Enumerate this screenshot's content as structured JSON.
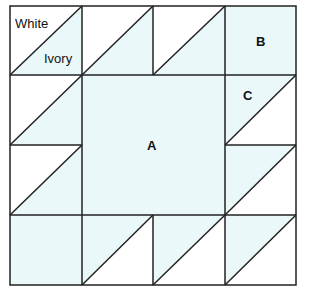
{
  "diagram": {
    "type": "quilt-block",
    "grid": {
      "rows": 4,
      "cols": 4
    },
    "colors": {
      "ivory": "#eaf8fa",
      "white": "#ffffff",
      "line": "#222222"
    },
    "labels": {
      "white": "White",
      "ivory": "Ivory",
      "a": "A",
      "b": "B",
      "c": "C"
    }
  }
}
